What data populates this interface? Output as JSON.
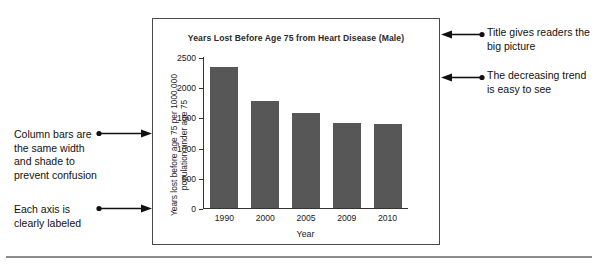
{
  "chart_data": {
    "type": "bar",
    "title": "Years Lost Before Age 75 from Heart Disease (Male)",
    "xlabel": "Year",
    "ylabel": "Years lost before age 75 per 1000,000 population under age 75",
    "ylabel_line1": "Years lost before age 75 per 1000,000",
    "ylabel_line2": "population under age 75",
    "categories": [
      "1990",
      "2000",
      "2005",
      "2009",
      "2010"
    ],
    "values": [
      2340,
      1770,
      1570,
      1410,
      1385
    ],
    "yticks": [
      0,
      500,
      1000,
      1500,
      2000,
      2500
    ],
    "ytick_labels": [
      "0",
      "500",
      "1000",
      "1500",
      "2000",
      "2500"
    ],
    "ylim": [
      0,
      2500
    ],
    "grid": false,
    "legend": "none",
    "bar_color": "#575757",
    "series_name": "Years lost before age 75"
  },
  "annotations": {
    "left": [
      {
        "id": "bars-note",
        "text": "Column bars are the same width and shade to prevent confusion"
      },
      {
        "id": "axis-note",
        "text": "Each axis is clearly labeled"
      }
    ],
    "right": [
      {
        "id": "title-note",
        "text": "Title gives readers the big picture"
      },
      {
        "id": "trend-note",
        "text": "The decreasing trend is easy to see"
      }
    ]
  },
  "colors": {
    "bar": "#575757",
    "frame": "#4a4a4a",
    "axis": "#333333",
    "rule": "#8c8c8c",
    "text": "#1a1a1a"
  }
}
